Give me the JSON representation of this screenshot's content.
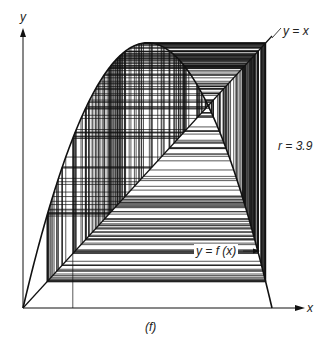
{
  "chart_data": {
    "type": "line",
    "subtype": "cobweb",
    "title": "",
    "panel_label": "(f)",
    "xlabel": "x",
    "ylabel": "y",
    "xlim": [
      0,
      1
    ],
    "ylim": [
      0,
      1
    ],
    "grid": false,
    "parameter": {
      "name": "r",
      "value": 3.9,
      "label": "r = 3.9"
    },
    "series": [
      {
        "name": "y = f(x)",
        "function": "r*x*(1-x)",
        "label": "y = f(x)"
      },
      {
        "name": "y = x",
        "function": "x",
        "label": "y = x"
      },
      {
        "name": "cobweb iterations",
        "x0": 0.2,
        "iterations": 220
      }
    ],
    "annotations": [
      {
        "text": "y = x",
        "position": "top-right, end of diagonal"
      },
      {
        "text": "r = 3.9",
        "position": "right side, mid-height"
      },
      {
        "text": "y = f(x)",
        "position": "lower right, arrow pointing to curve"
      },
      {
        "text": "(f)",
        "position": "below x-axis, center"
      }
    ],
    "ink_color": "#111111",
    "background": "#ffffff"
  },
  "labels": {
    "y_axis": "y",
    "x_axis": "x",
    "diagonal": "y = x",
    "param": "r = 3.9",
    "curve": "y = f (x)",
    "panel": "(f)"
  }
}
